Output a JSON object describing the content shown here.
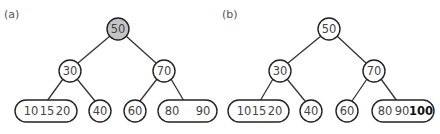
{
  "panels": [
    {
      "label": "(a)",
      "root": {
        "value": "50",
        "highlighted": true
      },
      "level1": [
        {
          "value": "30"
        },
        {
          "value": "70"
        }
      ],
      "leaves": [
        {
          "type": "multi",
          "values": [
            "10",
            "15",
            "20"
          ]
        },
        {
          "type": "single",
          "values": [
            "40"
          ]
        },
        {
          "type": "single",
          "values": [
            "60"
          ]
        },
        {
          "type": "multi",
          "values": [
            "80",
            "90"
          ]
        }
      ]
    },
    {
      "label": "(b)",
      "root": {
        "value": "50",
        "highlighted": false
      },
      "level1": [
        {
          "value": "30"
        },
        {
          "value": "70"
        }
      ],
      "leaves": [
        {
          "type": "multi",
          "values": [
            "10",
            "15",
            "20"
          ]
        },
        {
          "type": "single",
          "values": [
            "40"
          ]
        },
        {
          "type": "single",
          "values": [
            "60"
          ]
        },
        {
          "type": "multi",
          "values": [
            "80",
            "90",
            "100"
          ],
          "bold_value": "100"
        }
      ]
    }
  ],
  "colors": {
    "highlight_fill": "#c4c4c4",
    "stroke": "#222222",
    "text": "#444444"
  }
}
